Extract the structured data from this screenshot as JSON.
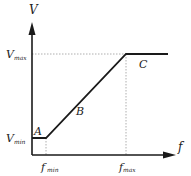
{
  "diagram": {
    "axes": {
      "y_label": "V",
      "x_label": "f",
      "y_ticks": [
        {
          "main": "V",
          "sub": "max"
        },
        {
          "main": "V",
          "sub": "min"
        }
      ],
      "x_ticks": [
        {
          "main": "f",
          "sub": "min"
        },
        {
          "main": "f",
          "sub": "max"
        }
      ]
    },
    "regions": [
      {
        "label": "A",
        "description": "constant V_min below f_min"
      },
      {
        "label": "B",
        "description": "linear rise from V_min to V_max"
      },
      {
        "label": "C",
        "description": "constant V_max above f_max"
      }
    ],
    "colors": {
      "line": "#1a1a1a",
      "axis": "#1a1a1a",
      "guide": "#9a9a9a"
    }
  },
  "labels": {
    "y_axis": "V",
    "x_axis": "f",
    "vmax_main": "V",
    "vmax_sub": "max",
    "vmin_main": "V",
    "vmin_sub": "min",
    "fmin_main": "f",
    "fmin_sub": "min",
    "fmax_main": "f",
    "fmax_sub": "max",
    "region_a": "A",
    "region_b": "B",
    "region_c": "C"
  }
}
